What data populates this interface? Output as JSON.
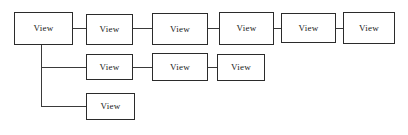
{
  "diagram": {
    "type": "tree-chain",
    "node_label": "View",
    "canvas": {
      "width": 408,
      "height": 135
    },
    "style": {
      "background_color": "#ffffff",
      "box_fill": "#ffffff",
      "box_border_color": "#2b2b2b",
      "connector_color": "#3a3a3a",
      "text_color": "#1a1a1a"
    },
    "rows": [
      {
        "name": "top-row",
        "nodes": [
          {
            "label": "View",
            "x": 14,
            "y": 12,
            "width": 59,
            "height": 33
          },
          {
            "label": "View",
            "x": 86,
            "y": 14,
            "width": 47,
            "height": 31
          },
          {
            "label": "View",
            "x": 152,
            "y": 13,
            "width": 56,
            "height": 32
          },
          {
            "label": "View",
            "x": 219,
            "y": 12,
            "width": 55,
            "height": 33
          },
          {
            "label": "View",
            "x": 281,
            "y": 13,
            "width": 55,
            "height": 30
          },
          {
            "label": "View",
            "x": 343,
            "y": 12,
            "width": 52,
            "height": 32
          }
        ]
      },
      {
        "name": "middle-row",
        "nodes": [
          {
            "label": "View",
            "x": 86,
            "y": 54,
            "width": 47,
            "height": 26
          },
          {
            "label": "View",
            "x": 152,
            "y": 53,
            "width": 56,
            "height": 28
          },
          {
            "label": "View",
            "x": 217,
            "y": 54,
            "width": 48,
            "height": 27
          }
        ]
      },
      {
        "name": "bottom-row",
        "nodes": [
          {
            "label": "View",
            "x": 86,
            "y": 93,
            "width": 49,
            "height": 27
          }
        ]
      }
    ],
    "connectors": {
      "top_row_links": [
        {
          "name": "link-top-1-2",
          "x": 73,
          "y": 28,
          "length": 13
        },
        {
          "name": "link-top-2-3",
          "x": 133,
          "y": 28,
          "length": 19
        },
        {
          "name": "link-top-3-4",
          "x": 208,
          "y": 28,
          "length": 11
        },
        {
          "name": "link-top-4-5",
          "x": 274,
          "y": 28,
          "length": 7
        },
        {
          "name": "link-top-5-6",
          "x": 336,
          "y": 28,
          "length": 7
        }
      ],
      "middle_row_links": [
        {
          "name": "link-mid-1-2",
          "x": 133,
          "y": 67,
          "length": 19
        },
        {
          "name": "link-mid-2-3",
          "x": 208,
          "y": 67,
          "length": 9
        }
      ],
      "trunk": {
        "name": "trunk-vertical",
        "x": 41,
        "y_start": 45,
        "y_end": 106
      },
      "branches": [
        {
          "name": "branch-to-middle-row",
          "x": 41,
          "y": 67,
          "length": 45
        },
        {
          "name": "branch-to-bottom-row",
          "x": 41,
          "y": 106,
          "length": 45
        }
      ]
    }
  }
}
